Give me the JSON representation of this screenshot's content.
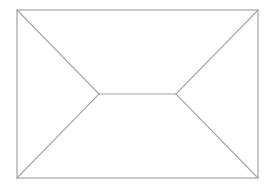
{
  "diagram": {
    "type": "line-drawing",
    "background_color": "#ffffff",
    "stroke_color": "#a3a3a3",
    "stroke_width": 1.2,
    "frame": {
      "x": 17,
      "y": 10,
      "width": 241,
      "height": 168
    },
    "ridge": {
      "x1": 99,
      "y1": 94,
      "x2": 176,
      "y2": 94
    },
    "edges": [
      {
        "name": "top-left-diagonal",
        "x1": 17,
        "y1": 10,
        "x2": 99,
        "y2": 94
      },
      {
        "name": "bottom-left-diagonal",
        "x1": 17,
        "y1": 178,
        "x2": 99,
        "y2": 94
      },
      {
        "name": "top-right-diagonal",
        "x1": 258,
        "y1": 10,
        "x2": 176,
        "y2": 94
      },
      {
        "name": "bottom-right-diagonal",
        "x1": 258,
        "y1": 178,
        "x2": 176,
        "y2": 94
      }
    ]
  }
}
